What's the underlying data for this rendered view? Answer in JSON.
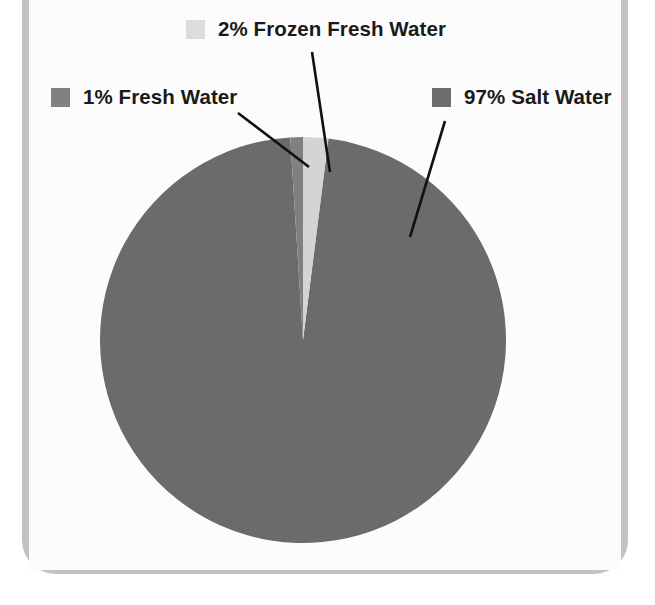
{
  "figure": {
    "kind": "pie-chart",
    "frame_color": "#c2c2c2",
    "background_color": "#fcfcfc"
  },
  "chart_data": {
    "type": "pie",
    "title": "",
    "subtitle": "",
    "xlabel": "",
    "ylabel": "",
    "legend_position": "callout-labels",
    "grid": false,
    "units": "percent",
    "categories": [
      "Salt Water",
      "Fresh Water",
      "Frozen Fresh Water"
    ],
    "values": [
      97,
      1,
      2
    ],
    "labels": [
      "97% Salt Water",
      "1% Fresh Water",
      "2% Frozen Fresh Water"
    ],
    "colors": [
      "#6b6b6b",
      "#808080",
      "#d4d4d4"
    ],
    "start_angle_deg": -90,
    "direction": "clockwise"
  },
  "legend": {
    "items": [
      {
        "name": "frozen-fresh-water",
        "label": "2% Frozen Fresh Water",
        "percent": 2,
        "swatch_color": "#dcdcdc"
      },
      {
        "name": "fresh-water",
        "label": "1% Fresh Water",
        "percent": 1,
        "swatch_color": "#818181"
      },
      {
        "name": "salt-water",
        "label": "97% Salt Water",
        "percent": 97,
        "swatch_color": "#6d6d6d"
      }
    ]
  },
  "leader_lines": {
    "frozen": "from label down to the light frozen-water wedge",
    "fresh": "from label right to the thin fresh-water sliver",
    "salt": "from label down-left into the large salt-water slice"
  }
}
